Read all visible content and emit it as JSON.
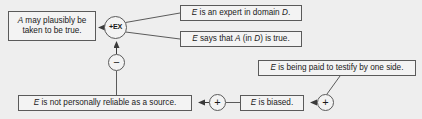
{
  "diagram": {
    "type": "argument-map",
    "background_color": "#eeeeee",
    "box_fill_color": "#f3f3f3",
    "line_color": "#5a5a5a",
    "nodes": {
      "conclusion": {
        "text": "A may plausibly be taken to be true."
      },
      "expert": {
        "text": "E is an expert in domain D."
      },
      "says": {
        "text": "E says that A (in D) is true."
      },
      "unreliable": {
        "text": "E is not personally reliable as a source."
      },
      "biased": {
        "text": "E is biased."
      },
      "paid": {
        "text": "E is being paid to testify by one side."
      }
    },
    "operators": {
      "expert_opinion": {
        "label": "+EX",
        "name": "plus-ex"
      },
      "minus": {
        "label": "−",
        "name": "minus"
      },
      "plus_left": {
        "label": "+",
        "name": "plus"
      },
      "plus_right": {
        "label": "+",
        "name": "plus"
      }
    }
  }
}
